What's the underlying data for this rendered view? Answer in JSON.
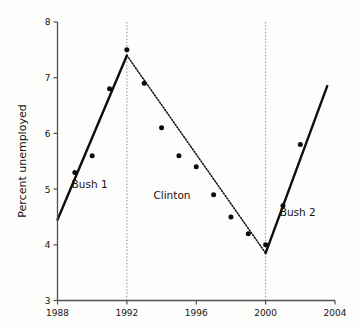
{
  "chart_data": {
    "type": "scatter",
    "title": "",
    "xlabel": "",
    "ylabel": "Percent unemployed",
    "xlim": [
      1988,
      2004
    ],
    "ylim": [
      3,
      8
    ],
    "xticks": [
      1988,
      1992,
      1996,
      2000,
      2004
    ],
    "yticks": [
      3,
      4,
      5,
      6,
      7,
      8
    ],
    "xtick_labels": [
      "1988",
      "1992",
      "1996",
      "2000",
      "2004"
    ],
    "ytick_labels": [
      "3",
      "4",
      "5",
      "6",
      "7",
      "8"
    ],
    "grid": false,
    "legend": "none",
    "x": [
      1988,
      1989,
      1990,
      1991,
      1992,
      1993,
      1994,
      1995,
      1996,
      1997,
      1998,
      1999,
      2000,
      2001,
      2002
    ],
    "values": [
      4.45,
      5.3,
      5.6,
      6.8,
      7.5,
      6.9,
      6.1,
      5.6,
      5.4,
      4.9,
      4.5,
      4.2,
      4.0,
      4.7,
      5.8
    ],
    "points": [
      {
        "x": 1989,
        "y": 5.3
      },
      {
        "x": 1990,
        "y": 5.6
      },
      {
        "x": 1991,
        "y": 6.8
      },
      {
        "x": 1992,
        "y": 7.5
      },
      {
        "x": 1993,
        "y": 6.9
      },
      {
        "x": 1994,
        "y": 6.1
      },
      {
        "x": 1995,
        "y": 5.6
      },
      {
        "x": 1996,
        "y": 5.4
      },
      {
        "x": 1997,
        "y": 4.9
      },
      {
        "x": 1998,
        "y": 4.5
      },
      {
        "x": 1999,
        "y": 4.2
      },
      {
        "x": 2000,
        "y": 4.0
      },
      {
        "x": 2001,
        "y": 4.7
      },
      {
        "x": 2002,
        "y": 5.8
      }
    ],
    "series": [
      {
        "name": "Bush 1 trend",
        "style": "solid",
        "x": [
          1988,
          1992
        ],
        "values": [
          4.45,
          7.4
        ]
      },
      {
        "name": "Clinton trend",
        "style": "dotted",
        "x": [
          1992,
          2000
        ],
        "values": [
          7.4,
          3.85
        ]
      },
      {
        "name": "Bush 2 trend",
        "style": "solid",
        "x": [
          2000,
          2003.55
        ],
        "values": [
          3.85,
          6.85
        ]
      }
    ],
    "annotations": [
      {
        "label": "Bush 1",
        "x": 1989.85,
        "y": 5.02
      },
      {
        "label": "Clinton",
        "x": 1994.6,
        "y": 4.83
      },
      {
        "label": "Bush 2",
        "x": 2001.85,
        "y": 4.52
      }
    ],
    "dividers": [
      1992,
      2000
    ],
    "colors": {
      "line": "#100d0b",
      "point": "#0d0b09",
      "axis": "#55514e",
      "divider": "#8a8a84",
      "background": "#fdfdfc"
    }
  }
}
